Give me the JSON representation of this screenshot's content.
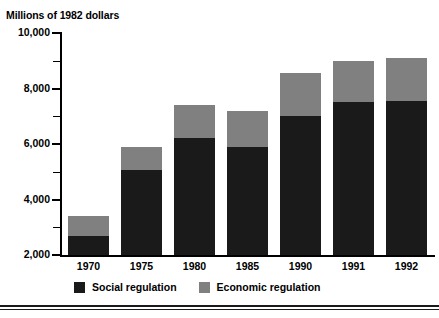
{
  "figure": {
    "axis_title": "Millions of 1982 dollars"
  },
  "chart_data": {
    "type": "bar",
    "stacked": true,
    "title": "",
    "subtitle": "",
    "xlabel": "",
    "ylabel": "Millions of 1982 dollars",
    "categories": [
      "1970",
      "1975",
      "1980",
      "1985",
      "1990",
      "1991",
      "1992"
    ],
    "series": [
      {
        "name": "Social regulation",
        "color": "#1a1a1a",
        "values": [
          2700,
          5050,
          6200,
          5900,
          7000,
          7500,
          7550
        ]
      },
      {
        "name": "Economic regulation",
        "color": "#808080",
        "values": [
          700,
          850,
          1200,
          1300,
          1550,
          1500,
          1550
        ]
      }
    ],
    "totals": [
      3400,
      5900,
      7400,
      7200,
      8550,
      9000,
      9100
    ],
    "ylim": [
      2000,
      10000
    ],
    "ytick_major": [
      "2,000",
      "4,000",
      "6,000",
      "8,000",
      "10,000"
    ],
    "ytick_major_values": [
      2000,
      4000,
      6000,
      8000,
      10000
    ],
    "ytick_minor_values": [
      3000,
      5000,
      7000,
      9000
    ],
    "grid": false,
    "legend_position": "bottom"
  },
  "legend": {
    "items": [
      {
        "label": "Social regulation",
        "color": "#1a1a1a"
      },
      {
        "label": "Economic regulation",
        "color": "#808080"
      }
    ]
  }
}
